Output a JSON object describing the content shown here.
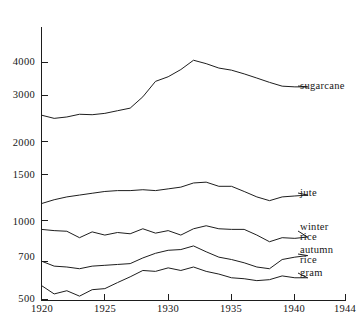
{
  "chart_data": {
    "type": "line",
    "title": "",
    "subtitle": "",
    "xlabel": "",
    "ylabel": "",
    "yscale": "log",
    "grid": false,
    "legend_position": "right-inline-labels",
    "xlim": [
      1920,
      1944
    ],
    "ylim": [
      500,
      4600
    ],
    "x_ticks": [
      1920,
      1925,
      1930,
      1935,
      1940,
      1944
    ],
    "x_tick_labels": [
      "1920",
      "1925",
      "1930",
      "1935",
      "1940",
      "1944"
    ],
    "y_ticks": [
      500,
      700,
      1000,
      1500,
      2000,
      3000,
      4000
    ],
    "y_tick_labels": [
      "500",
      "700",
      "1000",
      "1500",
      "2000",
      "3000",
      "4000"
    ],
    "x": [
      1920,
      1921,
      1922,
      1923,
      1924,
      1925,
      1926,
      1927,
      1928,
      1929,
      1930,
      1931,
      1932,
      1933,
      1934,
      1935,
      1936,
      1937,
      1938,
      1939,
      1940,
      1941
    ],
    "series": [
      {
        "name": "sugarcane",
        "label": "sugarcane",
        "values": [
          2520,
          2450,
          2480,
          2540,
          2530,
          2560,
          2620,
          2680,
          2960,
          3390,
          3530,
          3760,
          4080,
          3960,
          3810,
          3740,
          3620,
          3490,
          3360,
          3250,
          3230,
          3230
        ]
      },
      {
        "name": "jute",
        "label": "jute",
        "values": [
          1160,
          1200,
          1230,
          1250,
          1270,
          1290,
          1300,
          1300,
          1310,
          1300,
          1320,
          1340,
          1390,
          1400,
          1350,
          1350,
          1290,
          1230,
          1190,
          1230,
          1240,
          1250
        ]
      },
      {
        "name": "winter-rice",
        "label_line1": "winter",
        "label_line2": "rice",
        "values": [
          925,
          915,
          910,
          860,
          905,
          880,
          900,
          890,
          930,
          895,
          915,
          880,
          930,
          955,
          930,
          925,
          925,
          880,
          830,
          860,
          855,
          865
        ]
      },
      {
        "name": "autumn-rice",
        "label_line1": "autumn",
        "label_line2": "rice",
        "values": [
          700,
          670,
          665,
          655,
          670,
          675,
          680,
          685,
          720,
          750,
          770,
          775,
          800,
          760,
          725,
          710,
          690,
          665,
          655,
          710,
          725,
          735
        ]
      },
      {
        "name": "gram",
        "label": "gram",
        "values": [
          565,
          525,
          540,
          515,
          545,
          550,
          580,
          610,
          645,
          640,
          660,
          645,
          665,
          640,
          625,
          605,
          600,
          590,
          595,
          615,
          605,
          605
        ]
      }
    ]
  },
  "labels": {
    "sugarcane": "sugarcane",
    "jute": "jute",
    "winter_rice_1": "winter",
    "winter_rice_2": "rice",
    "autumn_rice_1": "autumn",
    "autumn_rice_2": "rice",
    "gram": "gram"
  },
  "axis": {
    "y_tick_labels": [
      "4000",
      "3000",
      "2000",
      "1500",
      "1000",
      "700",
      "500"
    ],
    "x_tick_labels": [
      "1920",
      "1925",
      "1930",
      "1935",
      "1940",
      "1944"
    ]
  },
  "colors": {
    "ink": "#1d1d1d",
    "background": "#ffffff"
  }
}
